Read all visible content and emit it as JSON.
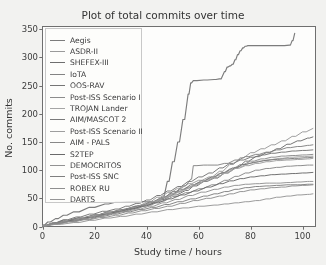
{
  "chart_data": {
    "type": "line",
    "title": "Plot of total commits over time",
    "xlabel": "Study time / hours",
    "ylabel": "No. commits",
    "xlim": [
      0,
      105
    ],
    "ylim": [
      0,
      355
    ],
    "xticks": [
      0,
      20,
      40,
      60,
      80,
      100
    ],
    "yticks": [
      0,
      50,
      100,
      150,
      200,
      250,
      300,
      350
    ],
    "grid": false,
    "legend_position": "upper left",
    "series": [
      {
        "name": "Aegis",
        "color": "#7c7c7c",
        "x": [
          0,
          2,
          5,
          8,
          12,
          18,
          24,
          28,
          33,
          36,
          40,
          44,
          46,
          48,
          50,
          52,
          54,
          56,
          57,
          58,
          62,
          66,
          68,
          70,
          71,
          72,
          73,
          74,
          75,
          76,
          77,
          78,
          79,
          80,
          84,
          88,
          92,
          95,
          96,
          97
        ],
        "y": [
          2,
          8,
          14,
          20,
          26,
          34,
          40,
          43,
          44,
          44,
          44,
          44,
          52,
          80,
          115,
          150,
          190,
          235,
          255,
          259,
          260,
          261,
          262,
          275,
          283,
          285,
          288,
          296,
          305,
          312,
          317,
          320,
          321,
          321,
          321,
          321,
          321,
          322,
          330,
          343
        ]
      },
      {
        "name": "ASDR-II",
        "color": "#9a9a9a",
        "x": [
          0,
          3,
          7,
          12,
          18,
          24,
          28,
          32,
          36,
          40,
          44,
          48,
          52,
          56,
          60,
          64,
          68,
          72,
          76,
          80,
          84,
          88,
          92,
          96,
          100,
          104
        ],
        "y": [
          1,
          5,
          9,
          13,
          17,
          21,
          27,
          32,
          37,
          43,
          52,
          60,
          68,
          76,
          82,
          88,
          98,
          110,
          122,
          131,
          138,
          145,
          152,
          160,
          168,
          174
        ]
      },
      {
        "name": "SHEFEX-III",
        "color": "#6e6e6e",
        "x": [
          0,
          4,
          8,
          14,
          20,
          25,
          30,
          35,
          40,
          45,
          50,
          55,
          58,
          62,
          66,
          70,
          74,
          78,
          82,
          86,
          90,
          94,
          98,
          102,
          104
        ],
        "y": [
          2,
          6,
          11,
          16,
          21,
          26,
          30,
          35,
          40,
          48,
          56,
          64,
          72,
          80,
          86,
          95,
          105,
          116,
          124,
          131,
          138,
          146,
          152,
          157,
          159
        ]
      },
      {
        "name": "IoTA",
        "color": "#838383",
        "x": [
          0,
          4,
          9,
          14,
          20,
          25,
          30,
          34,
          38,
          42,
          46,
          50,
          54,
          57,
          58,
          62,
          66,
          70,
          74,
          78,
          82,
          86,
          90,
          94,
          98,
          102,
          104
        ],
        "y": [
          1,
          5,
          10,
          15,
          20,
          25,
          29,
          34,
          38,
          44,
          52,
          62,
          72,
          84,
          108,
          109,
          109,
          112,
          118,
          124,
          128,
          132,
          136,
          140,
          142,
          144,
          145
        ]
      },
      {
        "name": "OOS-RAV",
        "color": "#757575",
        "x": [
          0,
          4,
          8,
          13,
          18,
          23,
          28,
          32,
          36,
          40,
          44,
          48,
          52,
          56,
          60,
          64,
          68,
          72,
          76,
          80,
          84,
          88,
          92,
          96,
          100,
          104
        ],
        "y": [
          2,
          7,
          12,
          17,
          22,
          27,
          31,
          36,
          41,
          47,
          55,
          63,
          71,
          80,
          88,
          95,
          104,
          112,
          118,
          123,
          127,
          130,
          132,
          134,
          135,
          136
        ]
      },
      {
        "name": "Post-ISS Scenario I",
        "color": "#8c8c8c",
        "x": [
          0,
          5,
          10,
          16,
          22,
          27,
          32,
          36,
          40,
          44,
          48,
          52,
          56,
          60,
          64,
          68,
          72,
          76,
          80,
          84,
          88,
          92,
          96,
          100,
          104
        ],
        "y": [
          1,
          6,
          11,
          16,
          21,
          25,
          30,
          34,
          39,
          46,
          54,
          62,
          70,
          78,
          86,
          94,
          102,
          110,
          116,
          120,
          123,
          125,
          126,
          127,
          128
        ]
      },
      {
        "name": "TROJAN Lander",
        "color": "#a5a5a5",
        "x": [
          0,
          4,
          9,
          15,
          21,
          26,
          31,
          35,
          39,
          43,
          47,
          51,
          55,
          59,
          63,
          67,
          71,
          75,
          79,
          83,
          87,
          91,
          95,
          99,
          104
        ],
        "y": [
          2,
          6,
          10,
          15,
          20,
          24,
          28,
          33,
          38,
          45,
          52,
          60,
          68,
          76,
          83,
          90,
          98,
          106,
          112,
          116,
          119,
          121,
          123,
          124,
          125
        ]
      },
      {
        "name": "AIM/MASCOT 2",
        "color": "#7a7a7a",
        "x": [
          0,
          4,
          8,
          13,
          19,
          24,
          29,
          33,
          37,
          41,
          45,
          49,
          53,
          57,
          61,
          65,
          69,
          73,
          77,
          81,
          85,
          89,
          93,
          97,
          101,
          104
        ],
        "y": [
          1,
          5,
          9,
          14,
          19,
          24,
          28,
          32,
          37,
          43,
          50,
          58,
          66,
          74,
          81,
          88,
          96,
          104,
          110,
          114,
          117,
          119,
          120,
          121,
          122,
          123
        ]
      },
      {
        "name": "Post-ISS Scenario II",
        "color": "#9e9e9e",
        "x": [
          0,
          5,
          10,
          15,
          20,
          25,
          30,
          34,
          38,
          42,
          46,
          50,
          54,
          58,
          62,
          66,
          70,
          74,
          78,
          82,
          86,
          90,
          94,
          98,
          102,
          104
        ],
        "y": [
          2,
          6,
          11,
          16,
          20,
          25,
          29,
          33,
          38,
          44,
          51,
          59,
          66,
          74,
          81,
          87,
          95,
          103,
          108,
          112,
          115,
          117,
          118,
          119,
          120,
          121
        ]
      },
      {
        "name": "AIM - PALS",
        "color": "#888888",
        "x": [
          0,
          4,
          9,
          14,
          20,
          25,
          30,
          35,
          40,
          45,
          50,
          55,
          60,
          65,
          70,
          74,
          78,
          82,
          86,
          90,
          94,
          98,
          102,
          104
        ],
        "y": [
          1,
          5,
          9,
          13,
          18,
          23,
          27,
          32,
          38,
          45,
          53,
          60,
          67,
          74,
          82,
          89,
          95,
          100,
          103,
          105,
          107,
          108,
          109,
          109
        ]
      },
      {
        "name": "S2TEP",
        "color": "#6a6a6a",
        "x": [
          0,
          5,
          11,
          17,
          23,
          28,
          33,
          38,
          43,
          48,
          53,
          58,
          63,
          68,
          72,
          76,
          80,
          84,
          88,
          92,
          96,
          100,
          104
        ],
        "y": [
          2,
          6,
          11,
          16,
          21,
          26,
          31,
          36,
          42,
          49,
          56,
          63,
          70,
          76,
          81,
          85,
          88,
          90,
          92,
          93,
          94,
          95,
          96
        ]
      },
      {
        "name": "DEMOCRITOS",
        "color": "#929292",
        "x": [
          0,
          4,
          9,
          15,
          21,
          26,
          31,
          36,
          41,
          46,
          51,
          56,
          61,
          66,
          70,
          74,
          78,
          82,
          86,
          90,
          94,
          98,
          102,
          104
        ],
        "y": [
          1,
          5,
          9,
          14,
          19,
          23,
          27,
          31,
          36,
          42,
          48,
          55,
          61,
          66,
          70,
          73,
          75,
          76,
          77,
          77,
          78,
          79,
          80,
          80
        ]
      },
      {
        "name": "Post-ISS SNC",
        "color": "#7f7f7f",
        "x": [
          0,
          5,
          10,
          16,
          22,
          27,
          32,
          37,
          42,
          47,
          52,
          57,
          62,
          66,
          70,
          74,
          78,
          82,
          86,
          90,
          94,
          98,
          102,
          104
        ],
        "y": [
          2,
          5,
          9,
          13,
          18,
          22,
          26,
          30,
          34,
          39,
          44,
          49,
          54,
          58,
          62,
          66,
          69,
          71,
          72,
          73,
          74,
          74,
          75,
          75
        ]
      },
      {
        "name": "ROBEX RU",
        "color": "#8f8f8f",
        "x": [
          0,
          4,
          10,
          16,
          22,
          28,
          33,
          38,
          43,
          48,
          53,
          58,
          63,
          68,
          72,
          76,
          80,
          84,
          88,
          92,
          96,
          100,
          104
        ],
        "y": [
          1,
          4,
          8,
          12,
          16,
          20,
          24,
          28,
          32,
          36,
          41,
          46,
          50,
          54,
          58,
          62,
          65,
          67,
          69,
          70,
          72,
          73,
          74
        ]
      },
      {
        "name": "DARTS",
        "color": "#969696",
        "x": [
          0,
          5,
          12,
          18,
          24,
          30,
          36,
          42,
          48,
          54,
          60,
          66,
          70,
          74,
          78,
          82,
          86,
          90,
          94,
          98,
          102,
          104
        ],
        "y": [
          1,
          4,
          7,
          11,
          15,
          18,
          22,
          26,
          30,
          33,
          36,
          38,
          40,
          42,
          44,
          46,
          49,
          52,
          54,
          56,
          57,
          58
        ]
      }
    ]
  },
  "axes": {
    "xtick_labels": [
      "0",
      "20",
      "40",
      "60",
      "80",
      "100"
    ],
    "ytick_labels": [
      "0",
      "50",
      "100",
      "150",
      "200",
      "250",
      "300",
      "350"
    ]
  }
}
